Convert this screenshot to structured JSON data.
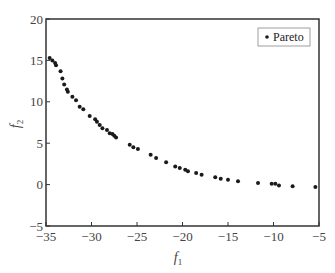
{
  "chart_data": {
    "type": "scatter",
    "title": "",
    "xlabel": "f1",
    "ylabel": "f2",
    "xlim": [
      -35,
      -5
    ],
    "ylim": [
      -5,
      20
    ],
    "xticks": [
      -35,
      -30,
      -25,
      -20,
      -15,
      -10,
      -5
    ],
    "yticks": [
      -5,
      0,
      5,
      10,
      15,
      20
    ],
    "xtick_labels": [
      "−35",
      "−30",
      "−25",
      "−20",
      "−15",
      "−10",
      "−5"
    ],
    "ytick_labels": [
      "−5",
      "0",
      "5",
      "10",
      "15",
      "20"
    ],
    "grid": false,
    "legend": {
      "position": "upper right",
      "entries": [
        "Pareto"
      ]
    },
    "series": [
      {
        "name": "Pareto",
        "marker": "dot",
        "color": "#1a1a1a",
        "x": [
          -34.6,
          -34.3,
          -34.0,
          -33.9,
          -33.4,
          -33.2,
          -33.0,
          -32.7,
          -32.6,
          -32.1,
          -31.7,
          -31.3,
          -30.9,
          -30.2,
          -29.6,
          -29.4,
          -29.1,
          -28.8,
          -28.3,
          -28.0,
          -27.7,
          -27.5,
          -27.3,
          -25.8,
          -25.4,
          -24.9,
          -23.5,
          -22.9,
          -21.8,
          -20.8,
          -20.3,
          -19.7,
          -19.4,
          -18.5,
          -17.9,
          -16.4,
          -15.8,
          -15.0,
          -13.9,
          -11.7,
          -10.2,
          -9.8,
          -9.4,
          -7.9,
          -5.4
        ],
        "y": [
          15.3,
          15.0,
          14.7,
          14.4,
          13.7,
          12.8,
          12.1,
          11.5,
          11.2,
          10.6,
          10.2,
          9.4,
          9.1,
          8.3,
          7.9,
          7.6,
          7.2,
          6.8,
          6.6,
          6.2,
          6.1,
          5.9,
          5.7,
          4.8,
          4.5,
          4.3,
          3.6,
          3.2,
          2.7,
          2.2,
          2.0,
          1.8,
          1.6,
          1.4,
          1.2,
          0.9,
          0.7,
          0.6,
          0.4,
          0.2,
          0.1,
          0.1,
          -0.1,
          -0.2,
          -0.3
        ]
      }
    ]
  },
  "labels": {
    "xlabel_main": "f",
    "xlabel_sub": "1",
    "ylabel_main": "f",
    "ylabel_sub": "2",
    "legend_entry": "Pareto"
  }
}
